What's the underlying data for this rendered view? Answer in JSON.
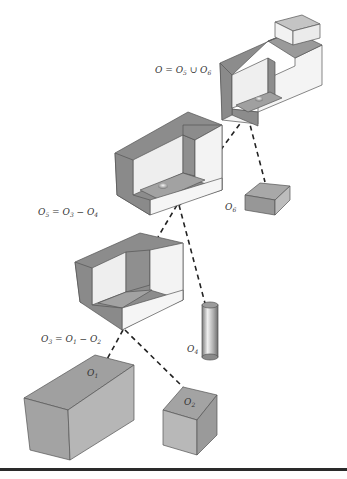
{
  "diagram": {
    "colors": {
      "dark_face": "#8c8c8c",
      "mid_face": "#a9a9a9",
      "light_face": "#d0d0d0",
      "white_face": "#f4f4f4",
      "inner_face": "#e8e8e8",
      "dash": "#222222",
      "rule": "#2a2a2a"
    },
    "equations": [
      {
        "id": "union",
        "lhs": "O",
        "op": "=",
        "terms": [
          {
            "base": "O",
            "sub": "5"
          },
          {
            "op": "∪"
          },
          {
            "base": "O",
            "sub": "6"
          }
        ]
      },
      {
        "id": "diff5",
        "lhs": {
          "base": "O",
          "sub": "5"
        },
        "op": "=",
        "terms": [
          {
            "base": "O",
            "sub": "3"
          },
          {
            "op": "−"
          },
          {
            "base": "O",
            "sub": "4"
          }
        ]
      },
      {
        "id": "diff3",
        "lhs": {
          "base": "O",
          "sub": "3"
        },
        "op": "=",
        "terms": [
          {
            "base": "O",
            "sub": "1"
          },
          {
            "op": "−"
          },
          {
            "base": "O",
            "sub": "2"
          }
        ]
      }
    ],
    "labels": {
      "eq_union": "O = O",
      "eq_union_s1": "5",
      "eq_union_op": " ∪ O",
      "eq_union_s2": "6",
      "eq_diff5": "O",
      "eq_diff5_s0": "5",
      "eq_diff5_mid": " = O",
      "eq_diff5_s1": "3",
      "eq_diff5_op": " − O",
      "eq_diff5_s2": "4",
      "eq_diff3": "O",
      "eq_diff3_s0": "3",
      "eq_diff3_mid": " = O",
      "eq_diff3_s1": "1",
      "eq_diff3_op": " − O",
      "eq_diff3_s2": "2",
      "o1": "O",
      "o1_sub": "1",
      "o2": "O",
      "o2_sub": "2",
      "o4": "O",
      "o4_sub": "4",
      "o6": "O",
      "o6_sub": "6"
    },
    "nodes": [
      {
        "id": "O",
        "name": "Final object (O5 with O6 block added)"
      },
      {
        "id": "O5",
        "name": "Stepped block with hole"
      },
      {
        "id": "O6",
        "name": "Small box"
      },
      {
        "id": "O3",
        "name": "Stepped block"
      },
      {
        "id": "O4",
        "name": "Cylinder"
      },
      {
        "id": "O1",
        "name": "Large box"
      },
      {
        "id": "O2",
        "name": "Cube"
      }
    ],
    "edges": [
      [
        "O",
        "O5"
      ],
      [
        "O",
        "O6"
      ],
      [
        "O5",
        "O3"
      ],
      [
        "O5",
        "O4"
      ],
      [
        "O3",
        "O1"
      ],
      [
        "O3",
        "O2"
      ]
    ]
  }
}
